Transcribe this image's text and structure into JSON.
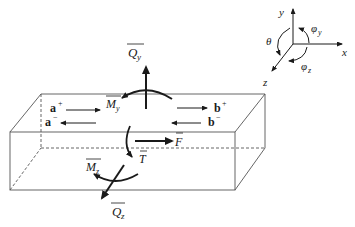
{
  "diagram": {
    "type": "beam-element-forces",
    "colors": {
      "stroke": "#1a1a1a",
      "box": "#555555",
      "background": "#ffffff"
    },
    "labels": {
      "Qy": {
        "main": "Q",
        "sub": "y"
      },
      "Qz": {
        "main": "Q",
        "sub": "z"
      },
      "My": {
        "main": "M",
        "sub": "y"
      },
      "Mz": {
        "main": "M",
        "sub": "z"
      },
      "F": "F",
      "T": "T",
      "a_plus": {
        "main": "a",
        "sup": "+"
      },
      "a_minus": {
        "main": "a",
        "sup": "−"
      },
      "b_plus": {
        "main": "b",
        "sup": "+"
      },
      "b_minus": {
        "main": "b",
        "sup": "−"
      }
    },
    "axes": {
      "x": "x",
      "y": "y",
      "z": "z",
      "theta": "θ",
      "phi_y": {
        "main": "φ",
        "sub": "y"
      },
      "phi_z": {
        "main": "φ",
        "sub": "z"
      }
    }
  }
}
